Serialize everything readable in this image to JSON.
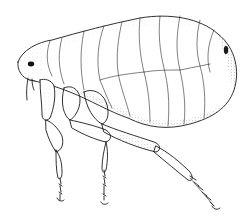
{
  "image": {
    "subject": "flea illustration",
    "style": "stippled pen-and-ink line drawing",
    "background": "#ffffff",
    "ink_color": "#1a1a1a"
  }
}
